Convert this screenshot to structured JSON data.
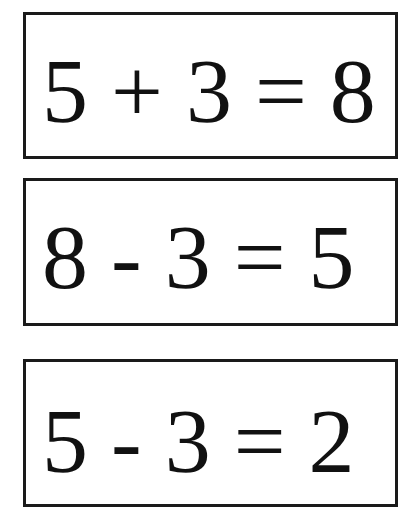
{
  "cards": [
    {
      "equation": "5 + 3 = 8"
    },
    {
      "equation": "8 - 3 = 5"
    },
    {
      "equation": "5 - 3 = 2"
    }
  ],
  "colors": {
    "border": "#1a1a1a",
    "text": "#111111",
    "background": "#ffffff"
  }
}
